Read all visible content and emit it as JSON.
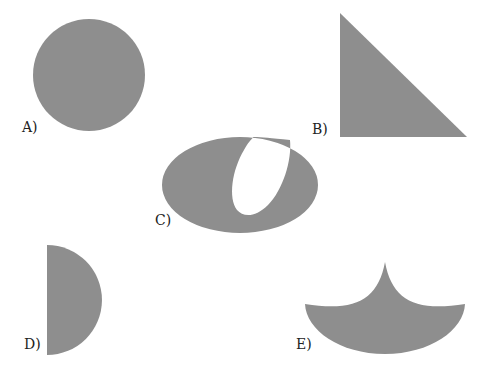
{
  "figure": {
    "background": "#ffffff",
    "shape_fill": "#8e8e8e",
    "shapes": [
      {
        "id": "A",
        "label": "A)",
        "kind": "circle"
      },
      {
        "id": "B",
        "label": "B)",
        "kind": "right-triangle"
      },
      {
        "id": "C",
        "label": "C)",
        "kind": "ellipse-with-slanted-cutout"
      },
      {
        "id": "D",
        "label": "D)",
        "kind": "half-disc"
      },
      {
        "id": "E",
        "label": "E)",
        "kind": "concave-arc-shape"
      }
    ]
  }
}
